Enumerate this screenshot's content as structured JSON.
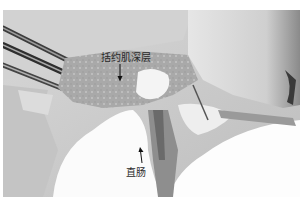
{
  "figure": {
    "type": "grayscale surgical photograph",
    "labels": [
      {
        "id": "sphincter",
        "text": "括约肌深层",
        "arrow_direction": "down"
      },
      {
        "id": "rectum",
        "text": "直肠",
        "arrow_direction": "up"
      }
    ]
  }
}
